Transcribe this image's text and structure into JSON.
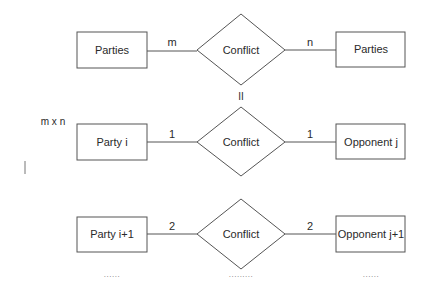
{
  "diagram": {
    "type": "entity-relationship",
    "row1": {
      "left_entity": "Parties",
      "relationship": "Conflict",
      "right_entity": "Parties",
      "left_cardinality": "m",
      "right_cardinality": "n"
    },
    "equivalence_symbol": "II",
    "multiplier_label": "m x n",
    "side_mark": "|",
    "row2": {
      "left_entity": "Party i",
      "relationship": "Conflict",
      "right_entity": "Opponent j",
      "left_cardinality": "1",
      "right_cardinality": "1"
    },
    "row3": {
      "left_entity": "Party i+1",
      "relationship": "Conflict",
      "right_entity": "Opponent j+1",
      "left_cardinality": "2",
      "right_cardinality": "2"
    },
    "continuation": {
      "left": "......",
      "middle": ".........",
      "right": "......"
    }
  }
}
